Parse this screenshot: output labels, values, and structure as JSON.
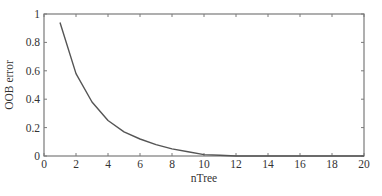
{
  "chart_data": {
    "type": "line",
    "title": "",
    "xlabel": "nTree",
    "ylabel": "OOB error",
    "xlim": [
      0,
      20
    ],
    "ylim": [
      0,
      1
    ],
    "xticks": [
      0,
      2,
      4,
      6,
      8,
      10,
      12,
      14,
      16,
      18,
      20
    ],
    "yticks": [
      0,
      0.2,
      0.4,
      0.6,
      0.8,
      1
    ],
    "ytick_labels": [
      "0",
      "0.2",
      "0.4",
      "0.6",
      "0.8",
      "1"
    ],
    "grid": false,
    "legend": null,
    "series": [
      {
        "name": "OOB error",
        "color": "#555555",
        "x": [
          1,
          2,
          3,
          4,
          5,
          6,
          7,
          8,
          9,
          10,
          11,
          12,
          13,
          14,
          15,
          16,
          17,
          18,
          19,
          20
        ],
        "values": [
          0.94,
          0.58,
          0.38,
          0.25,
          0.17,
          0.12,
          0.08,
          0.05,
          0.03,
          0.01,
          0.005,
          0,
          0,
          0,
          0,
          0,
          0,
          0,
          0,
          0
        ]
      }
    ]
  },
  "colors": {
    "axis": "#7a7a7a",
    "line": "#555555",
    "text": "#333333"
  }
}
